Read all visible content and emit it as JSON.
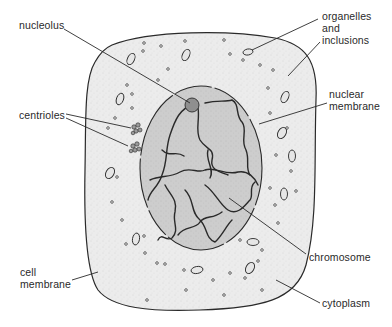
{
  "diagram": {
    "type": "animal-cell",
    "colors": {
      "background": "#ffffff",
      "cytoplasm_fill": "#ececec",
      "nucleus_fill": "#cfcfcf",
      "outline": "#2a2a2a",
      "text": "#2a2a2a"
    },
    "labels": {
      "nucleolus": "nucleolus",
      "organelles_line1": "organelles",
      "organelles_line2": "and",
      "organelles_line3": "inclusions",
      "nuclear_membrane_line1": "nuclear",
      "nuclear_membrane_line2": "membrane",
      "centrioles": "centrioles",
      "cell_membrane_line1": "cell",
      "cell_membrane_line2": "membrane",
      "chromosome": "chromosome",
      "cytoplasm": "cytoplasm"
    }
  }
}
